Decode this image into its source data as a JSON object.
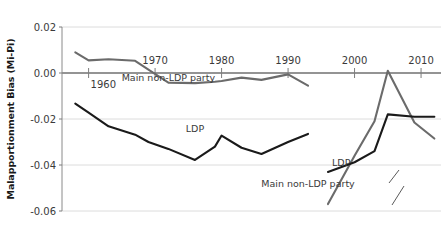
{
  "chart_data": {
    "type": "line",
    "title": "",
    "xlabel": "",
    "ylabel": "Malapportionment Bias (Mi-Pi)",
    "xlim": [
      1956,
      2013
    ],
    "ylim": [
      -0.06,
      0.02
    ],
    "grid": true,
    "legend_position": "inline-annotations",
    "y_ticks": [
      "0.02",
      "0.00",
      "-0.02",
      "-0.04",
      "-0.06"
    ],
    "y_tick_values": [
      0.02,
      0.0,
      -0.02,
      -0.04,
      -0.06
    ],
    "x_ticks": [
      "1960",
      "1970",
      "1980",
      "1990",
      "2000",
      "2010"
    ],
    "x_tick_values": [
      1960,
      1970,
      1980,
      1990,
      2000,
      2010
    ],
    "annotations": [
      {
        "text": "Main non-LDP party",
        "x": 1972,
        "y": -0.0035
      },
      {
        "text": "LDP",
        "x": 1976,
        "y": -0.0255
      },
      {
        "text": "LDP",
        "x": 1998,
        "y": -0.0405
      },
      {
        "text": "Main non-LDP party",
        "x": 1993,
        "y": -0.0495
      }
    ],
    "series": [
      {
        "name": "Main non-LDP party",
        "color": "#6b6b6b",
        "segments": [
          {
            "x": [
              1958,
              1960,
              1963,
              1967,
              1969,
              1972,
              1976,
              1979,
              1980,
              1983,
              1986,
              1990,
              1993
            ],
            "y": [
              0.009,
              0.0055,
              0.006,
              0.0053,
              0.0015,
              -0.0042,
              -0.0044,
              -0.0038,
              -0.0035,
              -0.002,
              -0.003,
              -0.0006,
              -0.0055
            ]
          },
          {
            "x": [
              1996,
              2000,
              2003,
              2005,
              2009,
              2012
            ],
            "y": [
              -0.057,
              -0.036,
              -0.021,
              0.001,
              -0.0215,
              -0.0285
            ]
          }
        ]
      },
      {
        "name": "LDP",
        "color": "#1a1a1a",
        "segments": [
          {
            "x": [
              1958,
              1960,
              1963,
              1967,
              1969,
              1972,
              1976,
              1979,
              1980,
              1983,
              1986,
              1990,
              1993
            ],
            "y": [
              -0.0133,
              -0.0172,
              -0.0232,
              -0.0268,
              -0.03,
              -0.033,
              -0.0378,
              -0.032,
              -0.0272,
              -0.0325,
              -0.0352,
              -0.03,
              -0.0265
            ]
          },
          {
            "x": [
              1996,
              2000,
              2003,
              2005,
              2009,
              2012
            ],
            "y": [
              -0.043,
              -0.0388,
              -0.034,
              -0.018,
              -0.019,
              -0.019
            ]
          }
        ]
      }
    ]
  },
  "axis": {
    "y_label": "Malapportionment Bias (Mi-Pi)"
  }
}
